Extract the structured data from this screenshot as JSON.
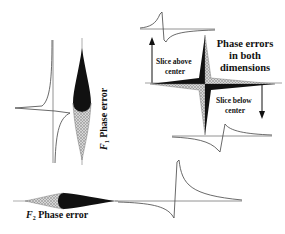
{
  "figure": {
    "title_main": "Phase errors in both dimensions",
    "title_lines": [
      "Phase errors",
      "in both",
      "dimensions"
    ],
    "slice_above": [
      "Slice above",
      "center"
    ],
    "slice_below": [
      "Slice below",
      "center"
    ],
    "f1_label": {
      "symbol": "F",
      "subscript": "1",
      "text": " Phase error"
    },
    "f2_label": {
      "symbol": "F",
      "subscript": "2",
      "text": " Phase error"
    }
  },
  "colors": {
    "ink": "#111111",
    "trace": "#444444",
    "hatch": "#bfbfbf",
    "background": "#ffffff"
  }
}
